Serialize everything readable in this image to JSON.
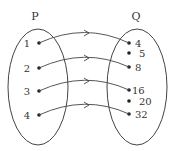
{
  "diagram": {
    "type": "mapping",
    "sets": [
      {
        "name": "P",
        "elements": [
          "1",
          "2",
          "3",
          "4"
        ]
      },
      {
        "name": "Q",
        "elements": [
          "4",
          "5",
          "8",
          "16",
          "20",
          "32"
        ]
      }
    ],
    "arrows": [
      {
        "from": "1",
        "to": "4"
      },
      {
        "from": "2",
        "to": "8"
      },
      {
        "from": "3",
        "to": "16"
      },
      {
        "from": "4",
        "to": "32"
      }
    ],
    "colors": {
      "stroke": "#333333",
      "background": "#ffffff"
    }
  },
  "labels": {
    "P": "P",
    "Q": "Q",
    "p": [
      "1",
      "2",
      "3",
      "4"
    ],
    "q": [
      "4",
      "5",
      "8",
      "16",
      "20",
      "32"
    ]
  }
}
